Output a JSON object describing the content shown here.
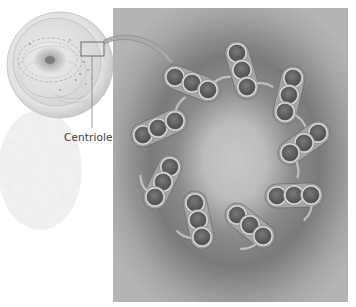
{
  "figure": {
    "labels": {
      "centriole": "Centriole"
    },
    "colors": {
      "background": "#ffffff",
      "panel_light": "#c4c4c4",
      "panel_dark": "#7c7c7c",
      "tubule_fill": "#5e5e5e",
      "tubule_rim": "#d8d8d8",
      "label_text": "#3a3a3a"
    },
    "cell": {
      "cx": 60,
      "cy": 65,
      "r": 53
    },
    "inset_box": {
      "x": 81,
      "y": 42,
      "w": 23,
      "h": 14
    },
    "panel": {
      "x": 113,
      "y": 8,
      "w": 235,
      "h": 294
    },
    "triplet_count": 9,
    "triplets": [
      {
        "name": "triplet-1",
        "circles": [
          [
            143,
            135
          ],
          [
            158,
            128
          ],
          [
            175,
            121
          ]
        ]
      },
      {
        "name": "triplet-2",
        "circles": [
          [
            175,
            77
          ],
          [
            192,
            83
          ],
          [
            208,
            90
          ]
        ]
      },
      {
        "name": "triplet-3",
        "circles": [
          [
            237,
            53
          ],
          [
            242,
            70
          ],
          [
            247,
            87
          ]
        ]
      },
      {
        "name": "triplet-4",
        "circles": [
          [
            293,
            78
          ],
          [
            289,
            95
          ],
          [
            285,
            112
          ]
        ]
      },
      {
        "name": "triplet-5",
        "circles": [
          [
            318,
            133
          ],
          [
            304,
            143
          ],
          [
            290,
            153
          ]
        ]
      },
      {
        "name": "triplet-6",
        "circles": [
          [
            277,
            196
          ],
          [
            294,
            195
          ],
          [
            311,
            195
          ]
        ]
      },
      {
        "name": "triplet-7",
        "circles": [
          [
            237,
            215
          ],
          [
            250,
            225
          ],
          [
            263,
            236
          ]
        ]
      },
      {
        "name": "triplet-8",
        "circles": [
          [
            195,
            203
          ],
          [
            198,
            220
          ],
          [
            202,
            237
          ]
        ]
      },
      {
        "name": "triplet-9",
        "circles": [
          [
            170,
            167
          ],
          [
            163,
            182
          ],
          [
            155,
            197
          ]
        ]
      }
    ]
  }
}
